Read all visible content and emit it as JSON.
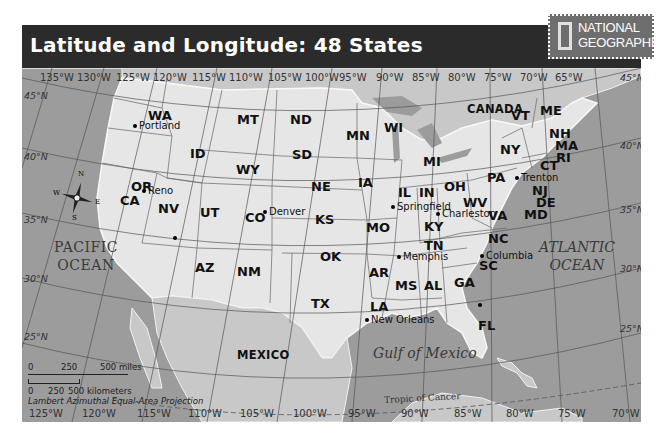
{
  "header": {
    "title": "Latitude and Longitude: 48 States",
    "logo_line1": "NATIONAL",
    "logo_line2": "GEOGRAPHIC",
    "bar_color": "#2b2b2b"
  },
  "map": {
    "colors": {
      "water": "#9c9c9c",
      "land_us": "#e6e6e6",
      "land_other": "#c8c8c8",
      "grid": "#555555"
    },
    "longitude_top": [
      "135°W",
      "130°W",
      "125°W",
      "120°W",
      "115°W",
      "110°W",
      "105°W",
      "100°W",
      "95°W",
      "90°W",
      "85°W",
      "80°W",
      "75°W",
      "70°W",
      "65°W"
    ],
    "longitude_bottom": [
      "125°W",
      "120°W",
      "115°W",
      "110°W",
      "105°W",
      "100°W",
      "95°W",
      "90°W",
      "85°W",
      "80°W",
      "75°W",
      "70°W"
    ],
    "latitude_left": [
      "45°N",
      "40°N",
      "35°N",
      "30°N",
      "25°N"
    ],
    "latitude_right": [
      "45°N",
      "40°N",
      "35°N",
      "30°N",
      "25°N"
    ],
    "states": [
      "WA",
      "OR",
      "CA",
      "ID",
      "NV",
      "UT",
      "AZ",
      "MT",
      "WY",
      "CO",
      "NM",
      "ND",
      "SD",
      "NE",
      "KS",
      "OK",
      "TX",
      "MN",
      "IA",
      "MO",
      "AR",
      "LA",
      "WI",
      "IL",
      "MI",
      "IN",
      "OH",
      "KY",
      "TN",
      "MS",
      "AL",
      "GA",
      "FL",
      "SC",
      "NC",
      "VA",
      "WV",
      "PA",
      "NY",
      "VT",
      "ME",
      "NH",
      "MA",
      "RI",
      "CT",
      "NJ",
      "DE",
      "MD"
    ],
    "cities": [
      "Portland",
      "Reno",
      "Denver",
      "Springfield",
      "Memphis",
      "New Orleans",
      "Charleston",
      "Columbia",
      "Trenton"
    ],
    "countries": [
      "CANADA",
      "MEXICO"
    ],
    "oceans": {
      "pacific_1": "PACIFIC",
      "pacific_2": "OCEAN",
      "atlantic_1": "ATLANTIC",
      "atlantic_2": "OCEAN",
      "gulf": "Gulf of Mexico"
    },
    "tropic_label": "Tropic of Cancer",
    "compass": {
      "n": "N",
      "s": "S",
      "e": "E",
      "w": "W"
    },
    "scale": {
      "miles": [
        "0",
        "250",
        "500 miles"
      ],
      "km": [
        "0",
        "250",
        "500 kilometers"
      ],
      "projection": "Lambert Azimuthal Equal-Area Projection"
    }
  }
}
